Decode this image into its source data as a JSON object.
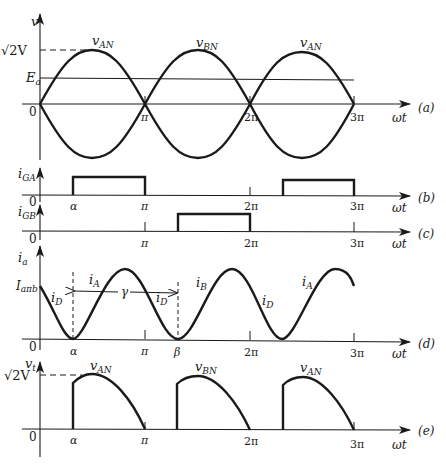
{
  "figure": {
    "x_axis_label": "ωt",
    "tick_labels": {
      "zero": "0",
      "pi": "π",
      "two_pi": "2π",
      "three_pi": "3π",
      "alpha": "α",
      "beta": "β"
    },
    "panels": [
      {
        "id": "a",
        "tag": "(a)",
        "y_label": "v",
        "y_ticks": {
          "peak": "√2V",
          "ea": "E",
          "ea_sub": "a",
          "zero": "0"
        },
        "curve_labels": [
          {
            "main": "v",
            "sub": "AN"
          },
          {
            "main": "v",
            "sub": "BN"
          },
          {
            "main": "v",
            "sub": "AN"
          }
        ]
      },
      {
        "id": "b",
        "tag": "(b)",
        "y_label_main": "i",
        "y_label_sub": "GA",
        "zero": "0"
      },
      {
        "id": "c",
        "tag": "(c)",
        "y_label_main": "i",
        "y_label_sub": "GB",
        "zero": "0"
      },
      {
        "id": "d",
        "tag": "(d)",
        "y_label_main": "i",
        "y_label_sub": "a",
        "y_tick_main": "I",
        "y_tick_sub": "aπb",
        "zero": "0",
        "gamma": "γ",
        "segment_labels": [
          {
            "main": "i",
            "sub": "D"
          },
          {
            "main": "i",
            "sub": "A"
          },
          {
            "main": "i",
            "sub": "D"
          },
          {
            "main": "i",
            "sub": "B"
          },
          {
            "main": "i",
            "sub": "D"
          },
          {
            "main": "i",
            "sub": "A"
          }
        ]
      },
      {
        "id": "e",
        "tag": "(e)",
        "y_label_main": "v",
        "y_label_sub": "t",
        "y_tick_peak": "√2V",
        "zero": "0",
        "curve_labels": [
          {
            "main": "v",
            "sub": "AN"
          },
          {
            "main": "v",
            "sub": "BN"
          },
          {
            "main": "v",
            "sub": "AN"
          }
        ]
      }
    ]
  }
}
